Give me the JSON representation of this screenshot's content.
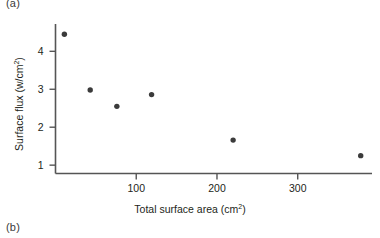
{
  "figure": {
    "panel_a_label": "(a)",
    "panel_b_label": "(b)"
  },
  "chart_data": {
    "type": "scatter",
    "title": "",
    "xlabel": "Total surface area (cm2)",
    "xlabel_base": "Total surface area (cm",
    "xlabel_sup": "2",
    "xlabel_tail": ")",
    "ylabel": "Surface flux (w/cm2)",
    "ylabel_base": "Surface flux (w/cm",
    "ylabel_sup": "2",
    "ylabel_tail": ")",
    "xlim": [
      0,
      392
    ],
    "ylim": [
      0.78,
      4.72
    ],
    "xticks": [
      100,
      200,
      300
    ],
    "xtick_labels": [
      "100",
      "200",
      "300"
    ],
    "yticks": [
      1,
      2,
      3,
      4
    ],
    "ytick_labels": [
      "1",
      "2",
      "3",
      "4"
    ],
    "grid": false,
    "legend": false,
    "marker": "filled-circle",
    "marker_color": "#3b3b3b",
    "marker_size_px": 5.4,
    "axis_color": "#555555",
    "points": [
      {
        "x": 11,
        "y": 4.45
      },
      {
        "x": 43,
        "y": 2.98
      },
      {
        "x": 76,
        "y": 2.55
      },
      {
        "x": 119,
        "y": 2.86
      },
      {
        "x": 220,
        "y": 1.66
      },
      {
        "x": 378,
        "y": 1.25
      }
    ],
    "series": [
      {
        "name": "Surface flux vs total surface area",
        "x": [
          11,
          43,
          76,
          119,
          220,
          378
        ],
        "values": [
          4.45,
          2.98,
          2.55,
          2.86,
          1.66,
          1.25
        ]
      }
    ]
  }
}
